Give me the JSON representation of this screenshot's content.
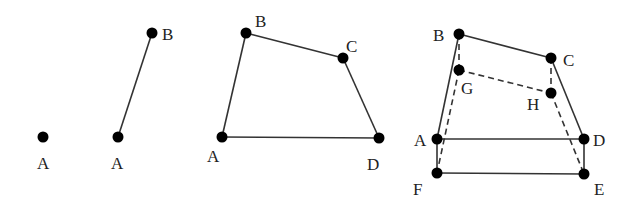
{
  "figures": [
    {
      "id": "fig1",
      "points": [
        {
          "name": "A",
          "x": 43,
          "y": 137,
          "lx": 37,
          "ly": 169
        }
      ],
      "solid_edges": [],
      "dashed_edges": []
    },
    {
      "id": "fig2",
      "points": [
        {
          "name": "A",
          "x": 118,
          "y": 137,
          "lx": 111,
          "ly": 169
        },
        {
          "name": "B",
          "x": 152,
          "y": 33,
          "lx": 162,
          "ly": 40
        }
      ],
      "solid_edges": [
        [
          "A",
          "B"
        ]
      ],
      "dashed_edges": []
    },
    {
      "id": "fig3",
      "points": [
        {
          "name": "A",
          "x": 222,
          "y": 137,
          "lx": 207,
          "ly": 162
        },
        {
          "name": "B",
          "x": 246,
          "y": 33,
          "lx": 255,
          "ly": 27
        },
        {
          "name": "C",
          "x": 343,
          "y": 58,
          "lx": 346,
          "ly": 52
        },
        {
          "name": "D",
          "x": 379,
          "y": 138,
          "lx": 367,
          "ly": 170
        }
      ],
      "solid_edges": [
        [
          "A",
          "B"
        ],
        [
          "B",
          "C"
        ],
        [
          "C",
          "D"
        ],
        [
          "A",
          "D"
        ]
      ],
      "dashed_edges": []
    },
    {
      "id": "fig4",
      "points": [
        {
          "name": "B",
          "x": 459,
          "y": 34,
          "lx": 433,
          "ly": 41
        },
        {
          "name": "C",
          "x": 551,
          "y": 58,
          "lx": 563,
          "ly": 66
        },
        {
          "name": "G",
          "x": 459,
          "y": 70,
          "lx": 461,
          "ly": 94
        },
        {
          "name": "H",
          "x": 551,
          "y": 93,
          "lx": 527,
          "ly": 110
        },
        {
          "name": "A",
          "x": 437,
          "y": 139,
          "lx": 414,
          "ly": 146
        },
        {
          "name": "D",
          "x": 584,
          "y": 139,
          "lx": 593,
          "ly": 146
        },
        {
          "name": "F",
          "x": 437,
          "y": 173,
          "lx": 413,
          "ly": 195
        },
        {
          "name": "E",
          "x": 584,
          "y": 174,
          "lx": 594,
          "ly": 195
        }
      ],
      "solid_edges": [
        [
          "B",
          "A"
        ],
        [
          "B",
          "C"
        ],
        [
          "C",
          "D"
        ],
        [
          "A",
          "D"
        ],
        [
          "A",
          "F"
        ],
        [
          "F",
          "E"
        ],
        [
          "D",
          "E"
        ]
      ],
      "dashed_edges": [
        [
          "B",
          "G"
        ],
        [
          "G",
          "F"
        ],
        [
          "G",
          "H"
        ],
        [
          "C",
          "H"
        ],
        [
          "H",
          "E"
        ]
      ]
    }
  ]
}
